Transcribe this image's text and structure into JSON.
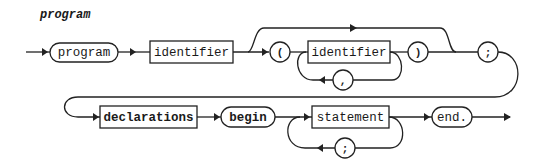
{
  "diagram": {
    "title": "program",
    "row1": {
      "program_keyword": "program",
      "identifier1": "identifier",
      "open_paren": "(",
      "identifier2": "identifier",
      "comma": ",",
      "close_paren": ")",
      "semicolon": ";"
    },
    "row2": {
      "declarations": "declarations",
      "begin_keyword": "begin",
      "statement": "statement",
      "semicolon": ";",
      "end_keyword": "end."
    },
    "colors": {
      "stroke": "#222222",
      "background": "#ffffff"
    }
  }
}
